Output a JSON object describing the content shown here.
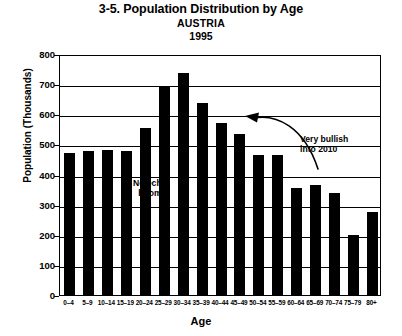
{
  "chart_data": {
    "type": "bar",
    "title": "3-5. Population Distribution by Age",
    "subtitle_country": "AUSTRIA",
    "subtitle_year": "1995",
    "xlabel": "Age",
    "ylabel": "Population (Thousands)",
    "ylim": [
      0,
      800
    ],
    "ytick_values": [
      800,
      700,
      600,
      500,
      400,
      300,
      200,
      100,
      0
    ],
    "ytick_labels": [
      "800",
      "700",
      "600",
      "500",
      "400",
      "300",
      "200",
      "100",
      "0"
    ],
    "grid": true,
    "legend": null,
    "bar_color": "#000000",
    "categories": [
      "0–4",
      "5–9",
      "10–14",
      "15–19",
      "20–24",
      "25–29",
      "30–34",
      "35–39",
      "40–44",
      "45–49",
      "50–54",
      "55–59",
      "60–64",
      "65–69",
      "70–74",
      "75–79",
      "80+"
    ],
    "values": [
      472,
      478,
      483,
      478,
      556,
      692,
      736,
      639,
      570,
      533,
      466,
      466,
      355,
      365,
      340,
      200,
      275
    ],
    "annotations": [
      {
        "name": "no-echo-boom",
        "text": "No echo\nboom",
        "x_category": "5–9",
        "value_level": 420
      },
      {
        "name": "very-bullish",
        "text": "Very bullish\ninto 2010",
        "x_category": "50–54",
        "value_level": 640
      }
    ],
    "arrow": {
      "name": "bullish-arrow",
      "description": "curved arrow pointing left toward the peak cohort",
      "points_to_category": "30–34"
    }
  }
}
